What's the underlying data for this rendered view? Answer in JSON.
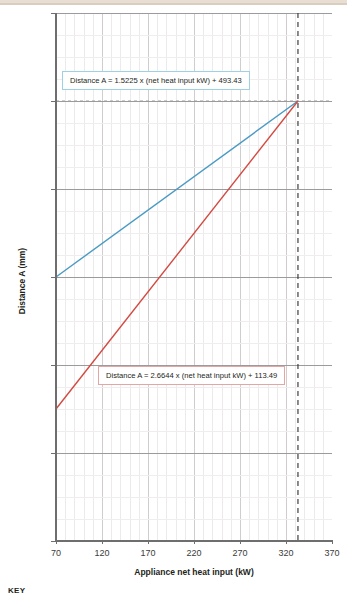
{
  "chart_data": {
    "type": "line",
    "title": "",
    "xlabel": "Appliance net heat input (kW)",
    "ylabel": "Distance A (mm)",
    "xlim": [
      70,
      370
    ],
    "ylim": [
      0,
      1200
    ],
    "xticks": [
      70,
      120,
      170,
      220,
      270,
      320,
      370
    ],
    "yticks": [
      0,
      200,
      400,
      600,
      800,
      1000,
      1200
    ],
    "x_major_step": 50,
    "x_minor_step": 10,
    "y_major_step": 200,
    "y_minor_step": 50,
    "grid": true,
    "legend": "none",
    "series": [
      {
        "name": "Distance A upper",
        "color": "#4a9ac4",
        "equation": "Distance A = 1.5225 x (net heat input kW) + 493.43",
        "slope": 1.5225,
        "intercept": 493.43,
        "x": [
          70,
          333
        ],
        "y": [
          600,
          1000
        ]
      },
      {
        "name": "Distance A lower",
        "color": "#d24a42",
        "equation": "Distance A = 2.6644 x (net heat input kW) + 113.49",
        "slope": 2.6644,
        "intercept": 113.49,
        "x": [
          70,
          333
        ],
        "y": [
          300,
          1000
        ]
      }
    ],
    "reference_lines": [
      {
        "name": "net-heat-input-limit",
        "orientation": "vertical",
        "x": 333,
        "style": "dashed",
        "color": "#3f3f3f"
      },
      {
        "name": "distance-a-limit",
        "orientation": "horizontal",
        "y": 1000,
        "style": "dashed",
        "color": "#9b9b9b"
      }
    ],
    "annotations": [
      {
        "name": "blue-equation",
        "text": "Distance A = 1.5225 x (net heat input kW) + 493.43",
        "border_color": "#9cd2e4"
      },
      {
        "name": "red-equation",
        "text": "Distance A = 2.6644 x (net heat input kW) + 113.49",
        "border_color": "#e3a7a3"
      }
    ]
  },
  "axes": {
    "x": {
      "label": "Appliance net heat input (kW)",
      "ticks": [
        "70",
        "120",
        "170",
        "220",
        "270",
        "320",
        "370"
      ]
    },
    "y": {
      "label": "Distance A (mm)",
      "ticks": [
        "0",
        "200",
        "400",
        "600",
        "800",
        "1000",
        "1200"
      ]
    }
  },
  "annotations": {
    "blue_equation": "Distance A = 1.5225 x (net heat input kW) + 493.43",
    "red_equation": "Distance A = 2.6644 x (net heat input kW) + 113.49"
  },
  "footer": {
    "key_label": "KEY"
  },
  "colors": {
    "blue_line": "#4a9ac4",
    "red_line": "#d24a42",
    "axis": "#6e6e6e",
    "band": "#e8ded2"
  }
}
